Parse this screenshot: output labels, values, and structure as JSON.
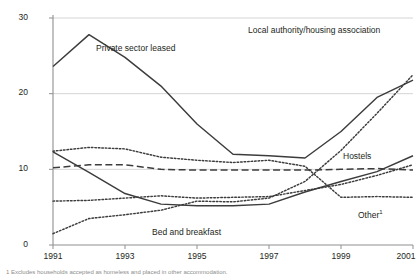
{
  "chart_data": {
    "type": "line",
    "title": "",
    "xlabel": "",
    "ylabel": "",
    "x": [
      1991,
      1992,
      1993,
      1994,
      1995,
      1996,
      1997,
      1998,
      1999,
      2000,
      2001
    ],
    "xlim": [
      1991,
      2001
    ],
    "ylim": [
      0,
      30
    ],
    "yticks": [
      0,
      10,
      20,
      30
    ],
    "xticks": [
      1991,
      1993,
      1995,
      1997,
      1999,
      2001
    ],
    "xtick_labels": [
      "1991",
      "1993",
      "1995",
      "1997",
      "1999",
      "2001"
    ],
    "ytick_labels": [
      "0",
      "10",
      "20",
      "30"
    ],
    "grid": "horizontal",
    "legend": "inline-annotations",
    "series": [
      {
        "name": "Private sector leased",
        "label": "Private sector leased",
        "style": "solid",
        "values": [
          23.6,
          27.8,
          24.8,
          21.0,
          16.0,
          12.0,
          11.8,
          11.5,
          15.0,
          19.5,
          21.8
        ],
        "label_x": 96,
        "label_y": 44,
        "label_align": "left"
      },
      {
        "name": "Local authority/housing association",
        "label": "Local authority/housing association",
        "style": "dotted",
        "values": [
          1.5,
          3.5,
          4.0,
          4.6,
          5.8,
          5.7,
          6.2,
          8.4,
          12.5,
          17.4,
          22.5
        ],
        "label_x": 310,
        "label_y": 26,
        "label_align": "center"
      },
      {
        "name": "Bed and breakfast",
        "label": "Bed and breakfast",
        "style": "solid",
        "values": [
          12.3,
          9.6,
          6.8,
          5.4,
          5.2,
          5.2,
          5.4,
          7.0,
          8.4,
          9.7,
          11.8
        ],
        "label_x": 152,
        "label_y": 228,
        "label_align": "left"
      },
      {
        "name": "Hostels",
        "label": "Hostels",
        "style": "dashed",
        "values": [
          10.2,
          10.6,
          10.6,
          10.0,
          9.9,
          9.9,
          9.9,
          9.9,
          10.0,
          10.1,
          9.9
        ],
        "label_x": 343,
        "label_y": 152,
        "label_align": "left"
      },
      {
        "name": "Other",
        "label": "Other",
        "label_superscript": "1",
        "style": "dotted",
        "values": [
          12.4,
          12.9,
          12.7,
          11.6,
          11.2,
          10.9,
          11.2,
          10.4,
          6.3,
          6.4,
          6.3
        ],
        "label_x": 358,
        "label_y": 209,
        "label_align": "left"
      },
      {
        "name": "Other (continued)",
        "label": "",
        "style": "dotted",
        "values_note": "rising tail of Other series 1997-2001",
        "values": [
          5.8,
          5.9,
          6.2,
          6.5,
          6.2,
          6.3,
          6.4,
          7.2,
          8.0,
          9.2,
          10.6
        ],
        "hidden": true
      }
    ],
    "colors": {
      "line": "#3c3c3c",
      "grid": "#c9c9c9",
      "axis": "#8f8f8f",
      "text": "#231f20",
      "background": "#ffffff"
    }
  },
  "footnote": {
    "text": "1 Excludes households accepted as homeless and placed in other accommodation."
  }
}
